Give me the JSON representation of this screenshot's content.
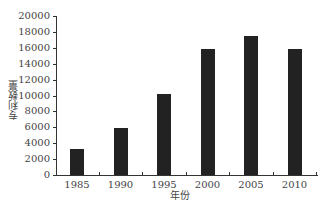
{
  "chart_data": {
    "type": "bar",
    "title": "",
    "xlabel": "年份",
    "ylabel": "专利数量",
    "categories": [
      "1985",
      "1990",
      "1995",
      "2000",
      "2005",
      "2010"
    ],
    "values": [
      3300,
      5900,
      10200,
      15900,
      17500,
      15900
    ],
    "ylim": [
      0,
      20000
    ],
    "yticks": [
      "0",
      "2000",
      "4000",
      "6000",
      "8000",
      "10000",
      "12000",
      "14000",
      "16000",
      "18000",
      "20000"
    ],
    "grid": false,
    "bar_color": "#222222"
  }
}
